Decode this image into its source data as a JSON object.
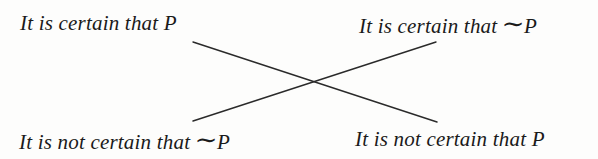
{
  "diagram": {
    "nodes": {
      "top_left": {
        "prefix": "It is certain that ",
        "negation": "",
        "prop": "P"
      },
      "top_right": {
        "prefix": "It is certain that ",
        "negation": "∼",
        "prop": "P"
      },
      "bottom_left": {
        "prefix": "It is not certain that ",
        "negation": "∼",
        "prop": "P"
      },
      "bottom_right": {
        "prefix": "It is not certain that ",
        "negation": "",
        "prop": "P"
      }
    },
    "edges": [
      {
        "from": "top_left",
        "to": "bottom_right",
        "x1": 193,
        "y1": 42,
        "x2": 437,
        "y2": 122
      },
      {
        "from": "top_right",
        "to": "bottom_left",
        "x1": 436,
        "y1": 42,
        "x2": 193,
        "y2": 121
      }
    ],
    "colors": {
      "text": "#1a1a1a",
      "line": "#2a2a2a",
      "background": "#fdfdfc"
    }
  }
}
